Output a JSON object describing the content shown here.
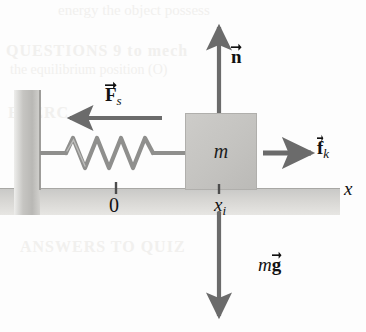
{
  "figure": {
    "colors": {
      "arrow": "#6b6b6b",
      "block_fill": "#c4c3c0",
      "wall_fill": "#c6c5c2",
      "ground_fill": "#d6d5d2",
      "spring": "#8c8c8a",
      "text": "#111111"
    }
  },
  "objects": {
    "block": {
      "label": "m",
      "name": "mass-block"
    },
    "wall": {
      "name": "wall"
    },
    "ground": {
      "name": "ground-surface"
    },
    "spring": {
      "name": "spring",
      "coils": 5
    }
  },
  "vectors": {
    "normal": {
      "symbol": "n",
      "subscript": "",
      "label": "n",
      "direction": "up"
    },
    "spring": {
      "symbol": "F",
      "subscript": "s",
      "label": "Fs",
      "direction": "left"
    },
    "friction": {
      "symbol": "f",
      "subscript": "k",
      "label": "fk",
      "direction": "right"
    },
    "weight": {
      "prefix": "m",
      "symbol": "g",
      "subscript": "",
      "label": "mg",
      "direction": "down"
    }
  },
  "axis": {
    "name": "x-axis",
    "label": "x",
    "ticks": [
      {
        "label": "0",
        "name": "tick-origin"
      },
      {
        "label": "x",
        "subscript": "i",
        "name": "tick-xi"
      }
    ]
  },
  "background_text": {
    "line1": "energy the object possess",
    "line2": "QUESTIONS 9 to mech",
    "line3": "the equilibrium position (O)",
    "line4": "EXERC",
    "line5": "ANSWERS TO QUIZ",
    "line6": ""
  }
}
